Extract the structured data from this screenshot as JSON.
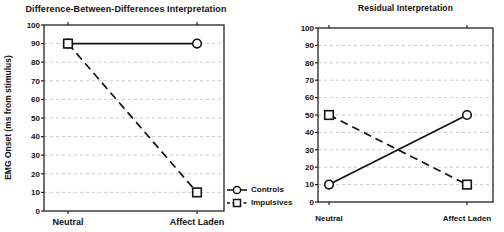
{
  "figure": {
    "background": "#ffffff",
    "text_color": "#111111",
    "grid_color": "#c8c8c8",
    "line_color": "#111111",
    "marker_fill": "#ffffff"
  },
  "chart_data": [
    {
      "type": "line",
      "title": "Difference-Between-Differences Interpretation",
      "ylabel": "EMG Onset (ms from stimulus)",
      "xlabel": "",
      "categories": [
        "Neutral",
        "Affect Laden"
      ],
      "ylim": [
        0,
        100
      ],
      "yticks": [
        0,
        10,
        20,
        30,
        40,
        50,
        60,
        70,
        80,
        90,
        100
      ],
      "grid": "horizontal-dashed",
      "legend_position": "outside-right-bottom",
      "series": [
        {
          "name": "Controls",
          "marker": "circle",
          "line": "solid",
          "values": [
            90,
            90
          ]
        },
        {
          "name": "Impulsives",
          "marker": "square",
          "line": "dashed",
          "values": [
            90,
            10
          ]
        }
      ]
    },
    {
      "type": "line",
      "title": "Residual Interpretation",
      "ylabel": "",
      "xlabel": "",
      "categories": [
        "Neutral",
        "Affect Laden"
      ],
      "ylim": [
        0,
        100
      ],
      "yticks": [
        0,
        10,
        20,
        30,
        40,
        50,
        60,
        70,
        80,
        90,
        100
      ],
      "grid": "horizontal-dashed",
      "series": [
        {
          "name": "Controls",
          "marker": "circle",
          "line": "solid",
          "values": [
            10,
            50
          ]
        },
        {
          "name": "Impulsives",
          "marker": "square",
          "line": "dashed",
          "values": [
            50,
            10
          ]
        }
      ]
    }
  ],
  "legend": {
    "items": [
      {
        "label": "Controls",
        "marker": "circle",
        "line": "solid"
      },
      {
        "label": "Impulsives",
        "marker": "square",
        "line": "dashed"
      }
    ]
  }
}
